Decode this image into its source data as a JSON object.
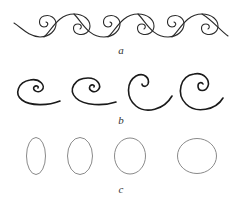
{
  "figure": {
    "panels": [
      {
        "id": "a",
        "label": "a",
        "description": "running wave scroll with six spirals"
      },
      {
        "id": "b",
        "label": "b",
        "description": "four open spirals of increasing size"
      },
      {
        "id": "c",
        "label": "c",
        "description": "four ellipses becoming progressively rounder"
      }
    ],
    "colors": {
      "stroke_a": "#2a2a2a",
      "stroke_b": "#1a1a1a",
      "stroke_c": "#8a8a8a",
      "background": "#ffffff"
    }
  }
}
